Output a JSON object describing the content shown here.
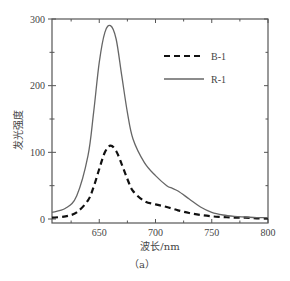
{
  "chart_data": {
    "type": "line",
    "title": "",
    "xlabel": "波长/nm",
    "ylabel": "发光强度",
    "caption": "（a）",
    "xlim": [
      608,
      800
    ],
    "ylim": [
      0,
      300
    ],
    "xticks": [
      650,
      700,
      750,
      800
    ],
    "yticks": [
      0,
      100,
      200,
      300
    ],
    "grid": false,
    "legend_position": "upper right",
    "series": [
      {
        "name": "B-1",
        "style": "dashed",
        "color": "#111111",
        "x": [
          608,
          620,
          630,
          640,
          645,
          650,
          655,
          660,
          665,
          670,
          675,
          680,
          690,
          700,
          710,
          720,
          730,
          740,
          750,
          760,
          770,
          780,
          790,
          800
        ],
        "y": [
          2,
          4,
          10,
          28,
          48,
          75,
          100,
          110,
          102,
          82,
          60,
          42,
          27,
          22,
          18,
          13,
          9,
          6,
          4,
          3,
          2,
          2,
          1,
          1
        ]
      },
      {
        "name": "R-1",
        "style": "solid",
        "color": "#666666",
        "x": [
          608,
          620,
          630,
          640,
          645,
          650,
          655,
          660,
          665,
          670,
          675,
          680,
          690,
          700,
          710,
          715,
          720,
          730,
          740,
          750,
          760,
          770,
          780,
          790,
          800
        ],
        "y": [
          10,
          16,
          35,
          95,
          160,
          235,
          280,
          290,
          270,
          215,
          160,
          120,
          85,
          65,
          50,
          46,
          42,
          30,
          18,
          10,
          6,
          4,
          3,
          2,
          2
        ]
      }
    ]
  }
}
